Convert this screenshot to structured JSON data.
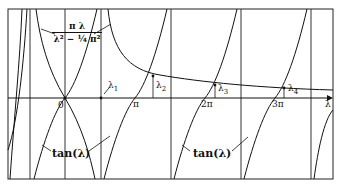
{
  "figure": {
    "axis_label": "λ",
    "origin_label": "0",
    "ticks": [
      {
        "label": "π"
      },
      {
        "label": "2π"
      },
      {
        "label": "3π"
      }
    ],
    "roots": [
      {
        "label": "λ",
        "sub": "1"
      },
      {
        "label": "λ",
        "sub": "2"
      },
      {
        "label": "λ",
        "sub": "3"
      },
      {
        "label": "λ",
        "sub": "4"
      }
    ],
    "curve_labels": {
      "rational_num": "π λ",
      "rational_den": "λ² − ¼ π²",
      "tan_left": "tan(λ)",
      "tan_right": "tan(λ)"
    },
    "colors": {
      "line": "#111111",
      "background": "#ffffff"
    }
  }
}
